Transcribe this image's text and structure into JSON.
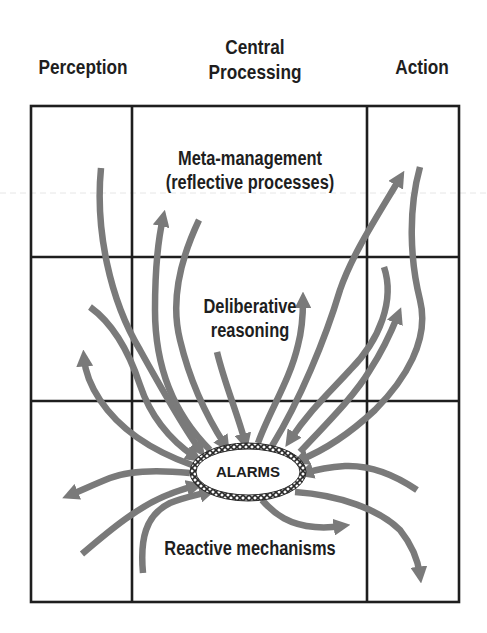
{
  "columns": {
    "perception": "Perception",
    "central_line1": "Central",
    "central_line2": "Processing",
    "action": "Action"
  },
  "layers": {
    "meta_line1": "Meta-management",
    "meta_line2": "(reflective processes)",
    "deliberative_line1": "Deliberative",
    "deliberative_line2": "reasoning",
    "reactive": "Reactive mechanisms"
  },
  "alarms": {
    "label": "ALARMS"
  },
  "colors": {
    "grid": "#1e1e1e",
    "arrow": "#7a7a7a",
    "text": "#1e1e1e",
    "background": "#ffffff"
  }
}
